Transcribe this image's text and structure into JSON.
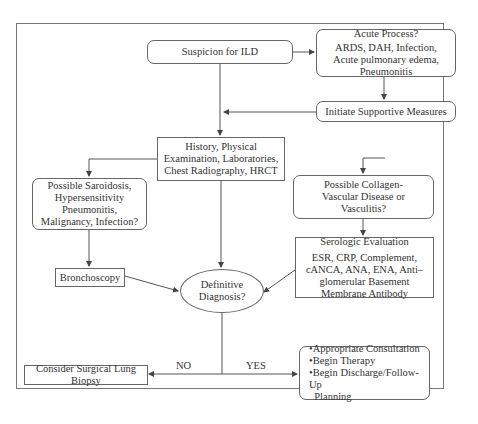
{
  "diagram": {
    "nodes": {
      "suspicion": {
        "label": "Suspicion for ILD"
      },
      "acute": {
        "title": "Acute Process?",
        "body": "ARDS, DAH, Infection, Acute pulmonary edema, Pneumonitis"
      },
      "supportive": {
        "label": "Initiate Supportive Measures"
      },
      "history": {
        "label": "History, Physical Examination, Laboratories, Chest Radiography, HRCT"
      },
      "sarcoid": {
        "label": "Possible Saroidosis, Hypersensitivity Pneumonitis, Malignancy, Infection?"
      },
      "collagen": {
        "label": "Possible Collagen-Vascular Disease or Vasculitis?"
      },
      "serologic": {
        "title": "Serologic Evaluation",
        "body": "ESR, CRP, Complement, cANCA, ANA, ENA, Anti–glomerular Basement Membrane Antibody"
      },
      "bronchoscopy": {
        "label": "Bronchoscopy"
      },
      "definitive": {
        "label": "Definitive Diagnosis?"
      },
      "biopsy": {
        "label": "Consider Surgical Lung Biopsy"
      },
      "outcome": {
        "items": [
          "•Appropriate Consultation",
          "•Begin Therapy",
          "•Begin Discharge/Follow-Up",
          "  Planning"
        ]
      }
    },
    "edge_labels": {
      "no": "NO",
      "yes": "YES"
    },
    "colors": {
      "line": "#555555",
      "border": "#666666",
      "text": "#333333",
      "background": "#ffffff"
    }
  }
}
